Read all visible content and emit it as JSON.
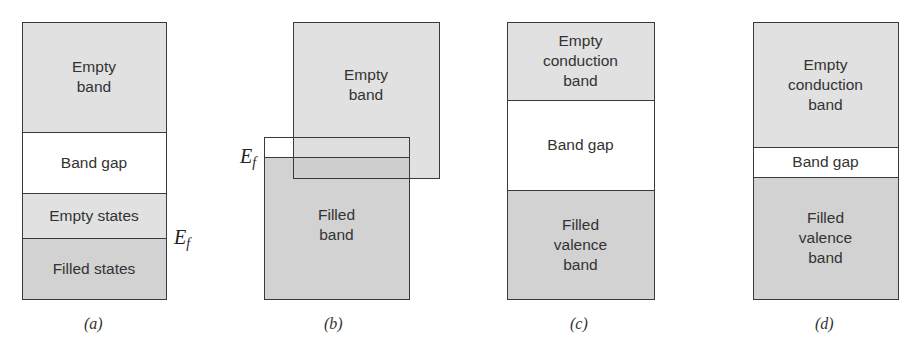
{
  "colors": {
    "empty_fill": "#e1e1e1",
    "filled_fill": "#d2d2d2",
    "gap_fill": "#ffffff",
    "outline": "#3a3a3a"
  },
  "fermi_symbol": "E",
  "fermi_subscript": "f",
  "panels": [
    {
      "id": "a",
      "caption": "(a)",
      "regions": [
        {
          "label": "Empty\nband",
          "fill": "empty"
        },
        {
          "label": "Band gap",
          "fill": "gap"
        },
        {
          "label": "Empty states",
          "fill": "empty"
        },
        {
          "label": "Filled states",
          "fill": "filled"
        }
      ]
    },
    {
      "id": "b",
      "caption": "(b)",
      "regions": [
        {
          "label": "Empty\nband",
          "fill": "empty"
        },
        {
          "label": "Filled\nband",
          "fill": "filled"
        }
      ]
    },
    {
      "id": "c",
      "caption": "(c)",
      "regions": [
        {
          "label": "Empty\nconduction\nband",
          "fill": "empty"
        },
        {
          "label": "Band gap",
          "fill": "gap"
        },
        {
          "label": "Filled\nvalence\nband",
          "fill": "filled"
        }
      ]
    },
    {
      "id": "d",
      "caption": "(d)",
      "regions": [
        {
          "label": "Empty\nconduction\nband",
          "fill": "empty"
        },
        {
          "label": "Band gap",
          "fill": "gap"
        },
        {
          "label": "Filled\nvalence\nband",
          "fill": "filled"
        }
      ]
    }
  ]
}
